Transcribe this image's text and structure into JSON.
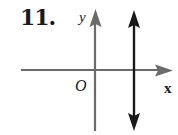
{
  "problem": {
    "number": "11."
  },
  "graph": {
    "y_axis_label": "y",
    "x_axis_label": "x",
    "origin_label": "O",
    "axis_color": "#6b6b6b",
    "line_color": "#1a1a1a",
    "line_description": "vertical line with arrows at both ends, to the right of the y-axis (x = positive constant)"
  }
}
